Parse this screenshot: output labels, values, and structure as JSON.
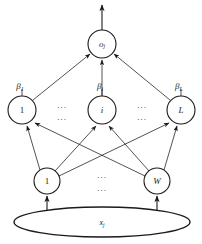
{
  "figure": {
    "background_color": "#ffffff",
    "stroke_color": "#1a1a1a"
  },
  "output_layer": {
    "node": {
      "label": "o",
      "subscript": "j",
      "cx": 102,
      "cy": 44,
      "r": 14
    },
    "output_arrow": {
      "from_y": 30,
      "to_y": 4,
      "x": 102
    }
  },
  "hidden_layer": {
    "nodes": [
      {
        "label": "1",
        "cx": 22,
        "cy": 110,
        "r": 14,
        "upright": true
      },
      {
        "label": "i",
        "cx": 102,
        "cy": 110,
        "r": 14,
        "upright": false
      },
      {
        "label": "L",
        "cx": 181,
        "cy": 110,
        "r": 14,
        "upright": false
      }
    ],
    "weights": [
      {
        "symbol": "β",
        "subscript": "1",
        "x": 20,
        "y": 92
      },
      {
        "symbol": "β",
        "subscript": "i",
        "x": 100,
        "y": 92
      },
      {
        "symbol": "β",
        "subscript": "L",
        "x": 180,
        "y": 92
      }
    ],
    "ellipses": [
      {
        "text": "...",
        "x": 62,
        "y": 106
      },
      {
        "text": "...",
        "x": 62,
        "y": 118
      },
      {
        "text": "...",
        "x": 142,
        "y": 106
      },
      {
        "text": "...",
        "x": 142,
        "y": 118
      }
    ]
  },
  "bottom_layer": {
    "nodes": [
      {
        "label": "1",
        "cx": 47,
        "cy": 181,
        "r": 13,
        "upright": true
      },
      {
        "label": "W",
        "cx": 157,
        "cy": 181,
        "r": 13,
        "upright": false
      }
    ],
    "ellipses": [
      {
        "text": "...",
        "x": 102,
        "y": 176
      },
      {
        "text": "...",
        "x": 102,
        "y": 189
      }
    ]
  },
  "input_layer": {
    "oval": {
      "cx": 102,
      "cy": 222,
      "rx": 88,
      "ry": 15
    },
    "label": "x",
    "subscript": "j",
    "label_x": 102,
    "label_y": 225
  },
  "edges": {
    "hidden_to_output": [
      {
        "from": "hidden-1",
        "x1": 33,
        "y1": 101,
        "x2": 92,
        "y2": 54
      },
      {
        "from": "hidden-i",
        "x1": 102,
        "y1": 96,
        "x2": 102,
        "y2": 58
      },
      {
        "from": "hidden-L",
        "x1": 170,
        "y1": 101,
        "x2": 112,
        "y2": 54
      }
    ],
    "bottom_to_hidden": [
      {
        "from": "bottom-1",
        "to": "hidden-1",
        "x1": 40,
        "y1": 170,
        "x2": 27,
        "y2": 124
      },
      {
        "from": "bottom-1",
        "to": "hidden-i",
        "x1": 55,
        "y1": 171,
        "x2": 96,
        "y2": 124
      },
      {
        "from": "bottom-1",
        "to": "hidden-L",
        "x1": 59,
        "y1": 175,
        "x2": 170,
        "y2": 122
      },
      {
        "from": "bottom-W",
        "to": "hidden-1",
        "x1": 145,
        "y1": 175,
        "x2": 34,
        "y2": 122
      },
      {
        "from": "bottom-W",
        "to": "hidden-i",
        "x1": 149,
        "y1": 171,
        "x2": 109,
        "y2": 124
      },
      {
        "from": "bottom-W",
        "to": "hidden-L",
        "x1": 164,
        "y1": 170,
        "x2": 177,
        "y2": 124
      }
    ],
    "input_to_bottom": [
      {
        "x": 47,
        "y1": 211,
        "y2": 196
      },
      {
        "x": 157,
        "y1": 211,
        "y2": 196
      }
    ]
  }
}
